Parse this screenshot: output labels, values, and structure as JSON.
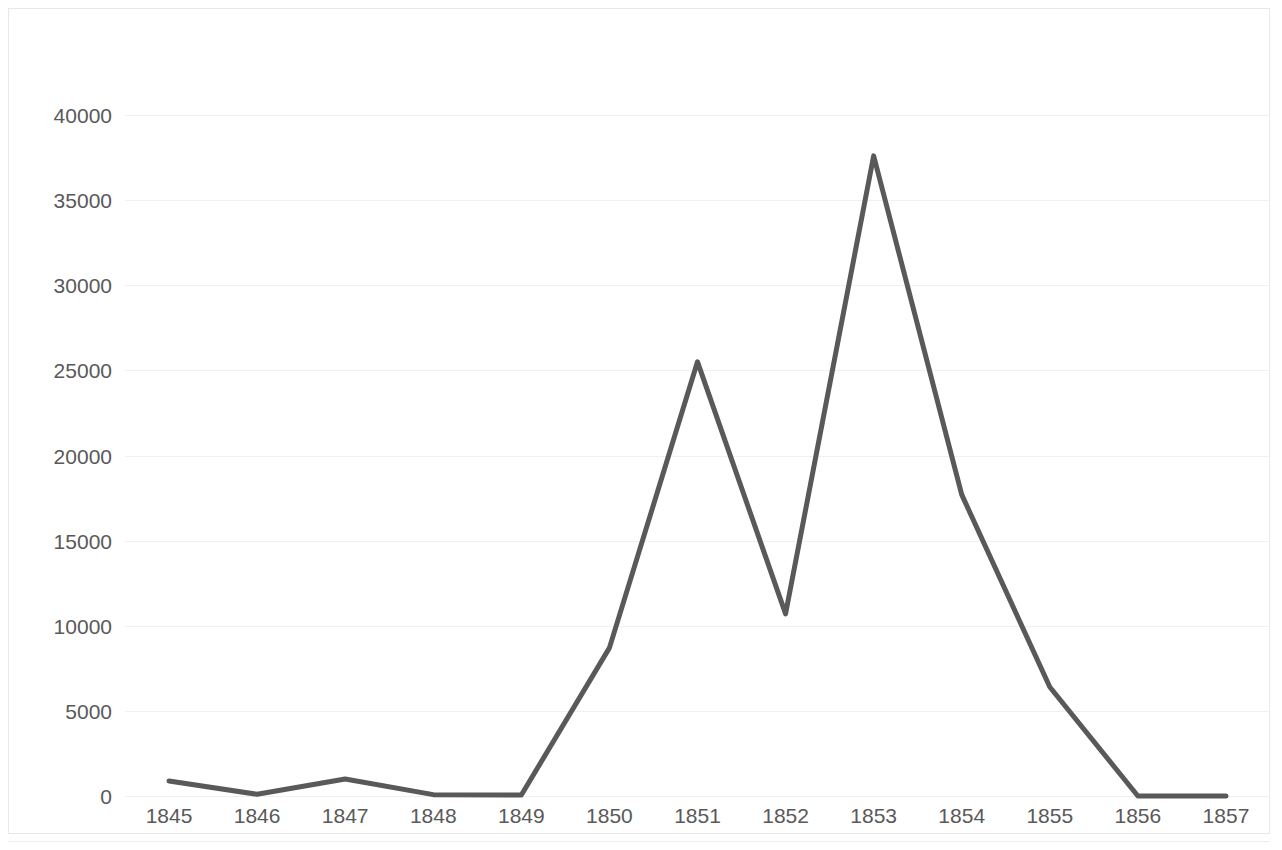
{
  "chart_data": {
    "type": "line",
    "title": "",
    "subtitle": "",
    "xlabel": "",
    "ylabel": "",
    "categories": [
      "1845",
      "1846",
      "1847",
      "1848",
      "1849",
      "1850",
      "1851",
      "1852",
      "1853",
      "1854",
      "1855",
      "1856",
      "1857"
    ],
    "values": [
      880,
      100,
      1000,
      80,
      60,
      8700,
      25500,
      10700,
      37600,
      17700,
      6400,
      0,
      0
    ],
    "series": [
      {
        "name": "",
        "values": [
          880,
          100,
          1000,
          80,
          60,
          8700,
          25500,
          10700,
          37600,
          17700,
          6400,
          0,
          0
        ]
      }
    ],
    "ylim": [
      0,
      40000
    ],
    "ytick_values": [
      0,
      5000,
      10000,
      15000,
      20000,
      25000,
      30000,
      35000,
      40000
    ],
    "ytick_labels": [
      "0",
      "5000",
      "10000",
      "15000",
      "20000",
      "25000",
      "30000",
      "35000",
      "40000"
    ],
    "xtick_labels": [
      "1845",
      "1846",
      "1847",
      "1848",
      "1849",
      "1850",
      "1851",
      "1852",
      "1853",
      "1854",
      "1855",
      "1856",
      "1857"
    ],
    "grid": true,
    "grid_axis": "y",
    "legend": false,
    "legend_position": "none",
    "annotations": [],
    "colors": {
      "line": "#595959",
      "gridline": "#f0f0f0",
      "tick_label": "#595959",
      "plot_background": "#ffffff",
      "border": "#e8e8e8"
    },
    "line_width": 5
  }
}
